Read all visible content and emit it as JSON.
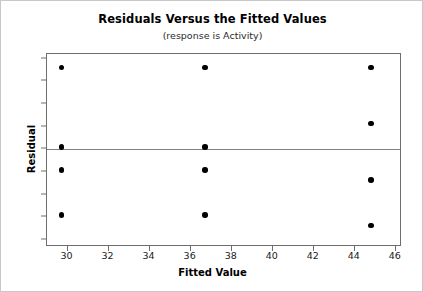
{
  "chart_data": {
    "type": "scatter",
    "title": "Residuals Versus the Fitted Values",
    "subtitle": "(response is Activity)",
    "xlabel": "Fitted Value",
    "ylabel": "Residual",
    "xlim": [
      29.0,
      46.3
    ],
    "ylim": [
      -8.6,
      8.4
    ],
    "xticks": [
      30,
      32,
      34,
      36,
      38,
      40,
      42,
      44,
      46
    ],
    "yticks": [
      8,
      6,
      4,
      2,
      0,
      -2,
      -4,
      -6,
      -8
    ],
    "xtick_labels": [
      "30",
      "32",
      "34",
      "36",
      "38",
      "40",
      "42",
      "44",
      "46"
    ],
    "ytick_labels": [
      "8",
      "6",
      "4",
      "2",
      "0",
      "-2",
      "-4",
      "-6",
      "-8"
    ],
    "grid": false,
    "legend": false,
    "reference_line": {
      "axis": "y",
      "value": 0,
      "color": "#808080"
    },
    "point_color": "#000000",
    "points": [
      {
        "x": 29.7,
        "y": 7.2
      },
      {
        "x": 29.7,
        "y": 0.2
      },
      {
        "x": 29.7,
        "y": -1.8
      },
      {
        "x": 29.7,
        "y": -5.8
      },
      {
        "x": 36.7,
        "y": 7.2
      },
      {
        "x": 36.7,
        "y": 0.2
      },
      {
        "x": 36.7,
        "y": -1.8
      },
      {
        "x": 36.7,
        "y": -5.8
      },
      {
        "x": 44.8,
        "y": 7.2
      },
      {
        "x": 44.8,
        "y": 2.3
      },
      {
        "x": 44.8,
        "y": -2.7
      },
      {
        "x": 44.8,
        "y": -6.7
      }
    ]
  }
}
